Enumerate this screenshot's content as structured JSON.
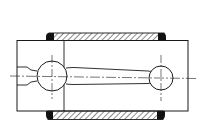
{
  "figure": {
    "title": "",
    "colors": {
      "background": "#ffffff",
      "line": "#1a1a1a",
      "hatch": "#2a2a2a",
      "fill_dark": "#111111"
    }
  },
  "elements": {
    "outer_block": {
      "x": 17,
      "y": 40,
      "w": 171,
      "h": 71
    },
    "parting_line_x": 64,
    "top_band": {
      "x": 47,
      "y": 33,
      "w": 119,
      "h": 8
    },
    "bottom_band": {
      "x": 46,
      "y": 111,
      "w": 119,
      "h": 9
    },
    "big_end": {
      "cx": 52,
      "cy": 76,
      "r": 15
    },
    "small_end": {
      "cx": 161,
      "cy": 78,
      "r": 12
    },
    "centerline_y": 77
  }
}
